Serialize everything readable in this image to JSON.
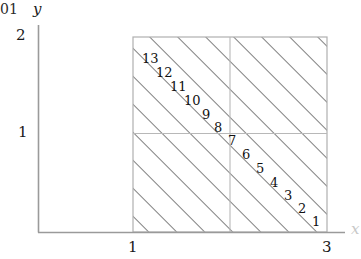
{
  "figure": {
    "clipped_fragment": "01",
    "axes": {
      "y_label": "y",
      "x_label": "x",
      "y_ticks": [
        {
          "label": "2",
          "value": 2
        },
        {
          "label": "1",
          "value": 1
        }
      ],
      "x_ticks": [
        {
          "label": "1",
          "value": 1
        },
        {
          "label": "3",
          "value": 3
        }
      ]
    },
    "region": {
      "x_min": 1,
      "x_max": 3,
      "y_min": 0,
      "y_max": 2,
      "hatch_angle_deg": 45,
      "hatch_color": "#808080",
      "border_color": "#b0b0b0",
      "gridline_color": "#b8b8b8",
      "grid_x": [
        2
      ],
      "grid_y": [
        1
      ]
    },
    "cell_numbers": [
      {
        "label": "13",
        "x": 142,
        "y": 52
      },
      {
        "label": "12",
        "x": 156,
        "y": 66
      },
      {
        "label": "11",
        "x": 170,
        "y": 80
      },
      {
        "label": "10",
        "x": 184,
        "y": 94
      },
      {
        "label": "9",
        "x": 202,
        "y": 108
      },
      {
        "label": "8",
        "x": 214,
        "y": 121
      },
      {
        "label": "7",
        "x": 228,
        "y": 134
      },
      {
        "label": "6",
        "x": 242,
        "y": 148
      },
      {
        "label": "5",
        "x": 256,
        "y": 162
      },
      {
        "label": "4",
        "x": 270,
        "y": 176
      },
      {
        "label": "3",
        "x": 284,
        "y": 189
      },
      {
        "label": "2",
        "x": 298,
        "y": 202
      },
      {
        "label": "1",
        "x": 312,
        "y": 215
      }
    ]
  }
}
